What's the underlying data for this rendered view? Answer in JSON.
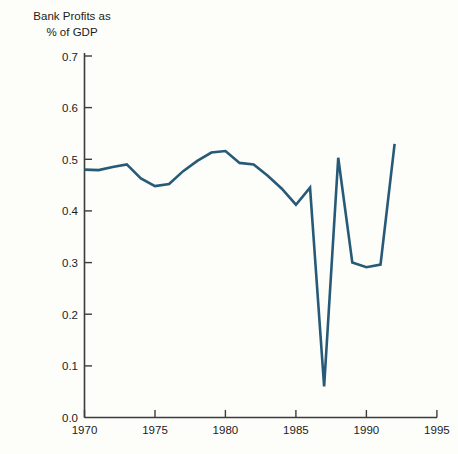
{
  "chart_data": {
    "type": "line",
    "title": "Bank Profits as\n% of GDP",
    "title_line1": "Bank Profits as",
    "title_line2": "% of GDP",
    "xlabel": "",
    "ylabel": "",
    "xlim": [
      1970,
      1995
    ],
    "ylim": [
      0.0,
      0.7
    ],
    "grid": false,
    "legend": false,
    "line_color": "#265a77",
    "axis_color": "#3c3c3c",
    "background_color": "#fdfdfa",
    "x_ticks": [
      1970,
      1975,
      1980,
      1985,
      1990,
      1995
    ],
    "x_tick_labels": [
      "1970",
      "1975",
      "1980",
      "1985",
      "1990",
      "1995"
    ],
    "y_ticks": [
      0.0,
      0.1,
      0.2,
      0.3,
      0.4,
      0.5,
      0.6,
      0.7
    ],
    "y_tick_labels": [
      "0.0",
      "0.1",
      "0.2",
      "0.3",
      "0.4",
      "0.5",
      "0.6",
      "0.7"
    ],
    "series": [
      {
        "name": "Bank Profits as % of GDP",
        "x": [
          1970,
          1971,
          1972,
          1973,
          1974,
          1975,
          1976,
          1977,
          1978,
          1979,
          1980,
          1981,
          1982,
          1983,
          1984,
          1985,
          1986,
          1987,
          1988,
          1989,
          1990,
          1991,
          1992
        ],
        "values": [
          0.48,
          0.479,
          0.485,
          0.49,
          0.463,
          0.448,
          0.452,
          0.477,
          0.497,
          0.513,
          0.516,
          0.493,
          0.49,
          0.468,
          0.443,
          0.412,
          0.445,
          0.06,
          0.503,
          0.3,
          0.291,
          0.296,
          0.53
        ]
      }
    ]
  }
}
